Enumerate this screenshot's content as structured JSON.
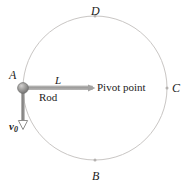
{
  "figure": {
    "colors": {
      "circle_stroke": "#c9c6c4",
      "rod": "#9a9a99",
      "ball_fill": "#8f8f8e",
      "ball_edge": "#6e6e6d",
      "vector": "#6e6e6d",
      "marker": "#b5b2b0",
      "text": "#1c1c1c",
      "background": "#ffffff"
    },
    "geometry": {
      "circle_center_x": 95,
      "circle_center_y": 88,
      "circle_radius": 72,
      "ball_x": 23,
      "ball_y": 88,
      "ball_radius": 5,
      "pivot_x": 95,
      "pivot_y": 88,
      "rod_start_x": 28,
      "rod_end_x": 93,
      "velocity_tip_x": 23,
      "velocity_tip_y": 128
    },
    "labels": {
      "point_a": "A",
      "point_b": "B",
      "point_c": "C",
      "point_d": "D",
      "rod_length": "L",
      "rod": "Rod",
      "pivot": "Pivot point",
      "velocity": "v",
      "velocity_subscript": "0"
    },
    "icons": {
      "ball": "ball-icon",
      "arrowhead": "arrowhead-icon",
      "pivot_marker": "pivot-marker-icon",
      "point_marker": "circle-point-marker-icon"
    }
  }
}
